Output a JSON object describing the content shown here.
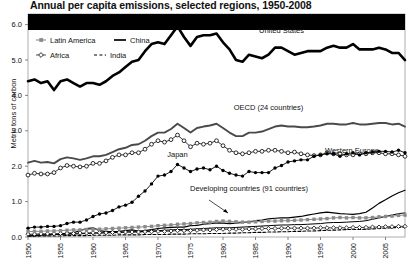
{
  "chart_data": {
    "type": "line",
    "title": "Annual per capita emissions, selected regions, 1950-2008",
    "xlabel": "",
    "ylabel": "Metric tons of carbon",
    "xlim": [
      1950,
      2008
    ],
    "ylim": [
      0.0,
      6.3
    ],
    "yticks": [
      "0.0",
      "1.0",
      "2.0",
      "3.0",
      "4.0",
      "5.0",
      "6.0"
    ],
    "ytick_values": [
      0.0,
      1.0,
      2.0,
      3.0,
      4.0,
      5.0,
      6.0
    ],
    "xticks": [
      "1950",
      "1955",
      "1960",
      "1965",
      "1970",
      "1975",
      "1980",
      "1985",
      "1990",
      "1995",
      "2000",
      "2005"
    ],
    "xtick_values": [
      1950,
      1955,
      1960,
      1965,
      1970,
      1975,
      1980,
      1985,
      1990,
      1995,
      2000,
      2005
    ],
    "grid": false,
    "legend_position": "top-left inside plot",
    "legend": [
      {
        "label": "Latin America",
        "marker": "filled-square",
        "color": "#808080",
        "dash": "solid"
      },
      {
        "label": "China",
        "marker": "none",
        "color": "#000000",
        "dash": "solid"
      },
      {
        "label": "Africa",
        "marker": "open-diamond",
        "color": "#000000",
        "dash": "solid"
      },
      {
        "label": "India",
        "marker": "none",
        "color": "#000000",
        "dash": "dashed"
      }
    ],
    "annotations": [
      {
        "text": "United States",
        "x": 1989,
        "y": 5.75
      },
      {
        "text": "OECD (24 countries)",
        "x": 1987,
        "y": 3.58
      },
      {
        "text": "Western Europe",
        "x": 2004,
        "y": 2.38
      },
      {
        "text": "Japan",
        "x": 1973,
        "y": 2.25
      },
      {
        "text": "Developing countries (91 countries)",
        "x": 1984,
        "y": 1.3
      }
    ],
    "x": [
      1950,
      1951,
      1952,
      1953,
      1954,
      1955,
      1956,
      1957,
      1958,
      1959,
      1960,
      1961,
      1962,
      1963,
      1964,
      1965,
      1966,
      1967,
      1968,
      1969,
      1970,
      1971,
      1972,
      1973,
      1974,
      1975,
      1976,
      1977,
      1978,
      1979,
      1980,
      1981,
      1982,
      1983,
      1984,
      1985,
      1986,
      1987,
      1988,
      1989,
      1990,
      1991,
      1992,
      1993,
      1994,
      1995,
      1996,
      1997,
      1998,
      1999,
      2000,
      2001,
      2002,
      2003,
      2004,
      2005,
      2006,
      2007,
      2008
    ],
    "series": [
      {
        "name": "United States",
        "style": "thick-solid-black",
        "values": [
          4.4,
          4.45,
          4.35,
          4.4,
          4.15,
          4.4,
          4.45,
          4.35,
          4.25,
          4.35,
          4.35,
          4.3,
          4.4,
          4.55,
          4.65,
          4.8,
          4.95,
          5.0,
          5.25,
          5.45,
          5.5,
          5.45,
          5.7,
          5.95,
          5.65,
          5.4,
          5.65,
          5.7,
          5.7,
          5.75,
          5.5,
          5.3,
          5.0,
          4.95,
          5.15,
          5.1,
          5.05,
          5.15,
          5.35,
          5.35,
          5.25,
          5.15,
          5.2,
          5.25,
          5.25,
          5.25,
          5.35,
          5.4,
          5.35,
          5.35,
          5.45,
          5.3,
          5.3,
          5.3,
          5.35,
          5.3,
          5.2,
          5.2,
          5.0
        ]
      },
      {
        "name": "OECD (24 countries)",
        "style": "medium-solid-gray",
        "values": [
          2.1,
          2.15,
          2.1,
          2.12,
          2.08,
          2.2,
          2.25,
          2.22,
          2.18,
          2.22,
          2.28,
          2.28,
          2.32,
          2.4,
          2.48,
          2.52,
          2.6,
          2.62,
          2.72,
          2.85,
          2.95,
          2.95,
          3.05,
          3.2,
          3.08,
          2.95,
          3.08,
          3.12,
          3.15,
          3.2,
          3.08,
          2.95,
          2.85,
          2.85,
          2.95,
          2.95,
          2.98,
          3.05,
          3.12,
          3.15,
          3.12,
          3.12,
          3.1,
          3.1,
          3.12,
          3.15,
          3.2,
          3.2,
          3.18,
          3.18,
          3.22,
          3.18,
          3.18,
          3.2,
          3.22,
          3.22,
          3.18,
          3.2,
          3.12
        ]
      },
      {
        "name": "Western Europe",
        "style": "open-circle-markers",
        "values": [
          1.75,
          1.8,
          1.78,
          1.78,
          1.82,
          1.95,
          2.02,
          2.0,
          1.98,
          2.0,
          2.08,
          2.08,
          2.15,
          2.25,
          2.32,
          2.32,
          2.38,
          2.38,
          2.48,
          2.62,
          2.72,
          2.68,
          2.75,
          2.88,
          2.72,
          2.55,
          2.65,
          2.62,
          2.65,
          2.72,
          2.58,
          2.45,
          2.38,
          2.35,
          2.38,
          2.42,
          2.42,
          2.45,
          2.45,
          2.42,
          2.38,
          2.4,
          2.35,
          2.32,
          2.3,
          2.32,
          2.38,
          2.35,
          2.35,
          2.32,
          2.32,
          2.35,
          2.35,
          2.38,
          2.38,
          2.35,
          2.35,
          2.32,
          2.28
        ]
      },
      {
        "name": "Japan",
        "style": "filled-circle-markers",
        "values": [
          0.25,
          0.28,
          0.28,
          0.3,
          0.3,
          0.32,
          0.38,
          0.42,
          0.42,
          0.48,
          0.58,
          0.65,
          0.68,
          0.75,
          0.85,
          0.9,
          0.98,
          1.15,
          1.3,
          1.5,
          1.72,
          1.75,
          1.85,
          2.05,
          1.95,
          1.85,
          1.92,
          1.95,
          1.9,
          2.0,
          1.88,
          1.8,
          1.75,
          1.72,
          1.85,
          1.82,
          1.82,
          1.82,
          1.95,
          2.02,
          2.12,
          2.15,
          2.18,
          2.18,
          2.28,
          2.32,
          2.35,
          2.35,
          2.28,
          2.35,
          2.38,
          2.32,
          2.38,
          2.4,
          2.42,
          2.42,
          2.4,
          2.45,
          2.38
        ]
      },
      {
        "name": "Developing countries (91 countries)",
        "style": "thin-solid-black",
        "values": [
          0.05,
          0.05,
          0.06,
          0.06,
          0.07,
          0.07,
          0.08,
          0.08,
          0.09,
          0.1,
          0.11,
          0.11,
          0.12,
          0.12,
          0.13,
          0.14,
          0.15,
          0.15,
          0.16,
          0.17,
          0.18,
          0.19,
          0.2,
          0.21,
          0.21,
          0.22,
          0.23,
          0.24,
          0.25,
          0.26,
          0.26,
          0.26,
          0.27,
          0.28,
          0.29,
          0.3,
          0.31,
          0.32,
          0.33,
          0.34,
          0.34,
          0.35,
          0.35,
          0.36,
          0.37,
          0.38,
          0.4,
          0.41,
          0.41,
          0.42,
          0.43,
          0.44,
          0.46,
          0.5,
          0.54,
          0.58,
          0.62,
          0.66,
          0.68
        ]
      },
      {
        "name": "China",
        "style": "thin-solid-black",
        "values": [
          0.03,
          0.04,
          0.05,
          0.06,
          0.07,
          0.08,
          0.1,
          0.12,
          0.18,
          0.24,
          0.26,
          0.18,
          0.15,
          0.15,
          0.16,
          0.18,
          0.2,
          0.17,
          0.18,
          0.21,
          0.24,
          0.26,
          0.27,
          0.28,
          0.28,
          0.32,
          0.33,
          0.36,
          0.38,
          0.4,
          0.39,
          0.38,
          0.39,
          0.41,
          0.43,
          0.46,
          0.48,
          0.51,
          0.53,
          0.54,
          0.54,
          0.56,
          0.58,
          0.62,
          0.65,
          0.68,
          0.7,
          0.68,
          0.66,
          0.65,
          0.64,
          0.66,
          0.7,
          0.82,
          0.95,
          1.05,
          1.16,
          1.25,
          1.32
        ]
      },
      {
        "name": "Latin America",
        "style": "gray-square-markers",
        "values": [
          0.15,
          0.16,
          0.16,
          0.17,
          0.17,
          0.18,
          0.19,
          0.2,
          0.2,
          0.21,
          0.22,
          0.22,
          0.23,
          0.24,
          0.25,
          0.26,
          0.27,
          0.28,
          0.29,
          0.3,
          0.32,
          0.33,
          0.34,
          0.36,
          0.37,
          0.38,
          0.4,
          0.41,
          0.42,
          0.44,
          0.45,
          0.44,
          0.43,
          0.42,
          0.42,
          0.43,
          0.44,
          0.45,
          0.45,
          0.46,
          0.46,
          0.47,
          0.48,
          0.49,
          0.5,
          0.51,
          0.52,
          0.54,
          0.55,
          0.54,
          0.55,
          0.54,
          0.54,
          0.55,
          0.57,
          0.58,
          0.59,
          0.61,
          0.62
        ]
      },
      {
        "name": "Africa",
        "style": "open-diamond-markers",
        "values": [
          0.08,
          0.08,
          0.09,
          0.09,
          0.09,
          0.1,
          0.1,
          0.1,
          0.11,
          0.11,
          0.12,
          0.12,
          0.12,
          0.13,
          0.13,
          0.14,
          0.14,
          0.14,
          0.15,
          0.15,
          0.16,
          0.16,
          0.17,
          0.18,
          0.18,
          0.18,
          0.19,
          0.2,
          0.2,
          0.21,
          0.22,
          0.22,
          0.22,
          0.22,
          0.23,
          0.23,
          0.24,
          0.24,
          0.24,
          0.25,
          0.25,
          0.25,
          0.25,
          0.25,
          0.25,
          0.26,
          0.26,
          0.26,
          0.26,
          0.26,
          0.27,
          0.27,
          0.27,
          0.28,
          0.28,
          0.29,
          0.29,
          0.3,
          0.3
        ]
      },
      {
        "name": "India",
        "style": "dashed-black",
        "values": [
          0.02,
          0.02,
          0.03,
          0.03,
          0.03,
          0.03,
          0.04,
          0.04,
          0.04,
          0.04,
          0.05,
          0.05,
          0.05,
          0.05,
          0.06,
          0.06,
          0.06,
          0.06,
          0.07,
          0.07,
          0.07,
          0.07,
          0.08,
          0.08,
          0.08,
          0.09,
          0.09,
          0.09,
          0.1,
          0.1,
          0.1,
          0.11,
          0.11,
          0.12,
          0.12,
          0.13,
          0.13,
          0.14,
          0.14,
          0.15,
          0.15,
          0.16,
          0.16,
          0.17,
          0.17,
          0.18,
          0.19,
          0.19,
          0.2,
          0.21,
          0.21,
          0.21,
          0.22,
          0.23,
          0.24,
          0.25,
          0.26,
          0.27,
          0.28
        ]
      }
    ]
  }
}
